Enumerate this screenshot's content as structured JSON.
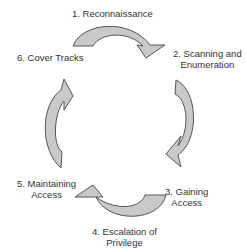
{
  "diagram": {
    "type": "cycle",
    "colors": {
      "arrow_fill": "#c9c9c9",
      "arrow_stroke": "#555555",
      "text": "#333333",
      "background": "#ffffff"
    },
    "steps": [
      {
        "number": 1,
        "label": "1. Reconnaissance",
        "line1": "1. Reconnaissance",
        "line2": ""
      },
      {
        "number": 2,
        "label": "2. Scanning and Enumeration",
        "line1": "2. Scanning and",
        "line2": "Enumeration"
      },
      {
        "number": 3,
        "label": "3. Gaining Access",
        "line1": "3. Gaining",
        "line2": "Access"
      },
      {
        "number": 4,
        "label": "4. Escalation of Privilege",
        "line1": "4. Escalation of",
        "line2": "Privilege"
      },
      {
        "number": 5,
        "label": "5. Maintaining Access",
        "line1": "5. Maintaining",
        "line2": "Access"
      },
      {
        "number": 6,
        "label": "6. Cover Tracks",
        "line1": "6. Cover Tracks",
        "line2": ""
      }
    ],
    "arrows": [
      {
        "from": 1,
        "to": 2,
        "icon": "curved-arrow-right-icon"
      },
      {
        "from": 2,
        "to": 3,
        "icon": "curved-arrow-down-icon"
      },
      {
        "from": 3,
        "to": 4,
        "icon": "curved-arrow-left-icon"
      },
      {
        "from": 5,
        "to": 6,
        "icon": "curved-arrow-up-icon"
      }
    ]
  }
}
